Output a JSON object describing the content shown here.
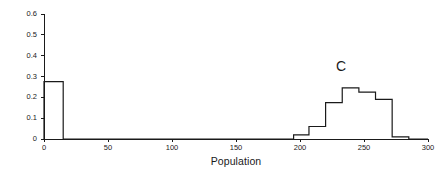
{
  "chart_data": {
    "type": "bar",
    "title": "",
    "subtitle": "",
    "xlabel": "Population",
    "ylabel": "Fraction of Runs",
    "xlim": [
      0,
      300
    ],
    "ylim": [
      0,
      0.6
    ],
    "xticks": [
      0,
      50,
      100,
      150,
      200,
      250,
      300
    ],
    "xtick_labels": [
      "0",
      "50",
      "100",
      "150",
      "200",
      "250",
      "300"
    ],
    "yticks": [
      0,
      0.1,
      0.2,
      0.3,
      0.4,
      0.5,
      0.6
    ],
    "ytick_labels": [
      "0",
      "0.1",
      "0.2",
      "0.3",
      "0.4",
      "0.5",
      "0.6"
    ],
    "grid": false,
    "legend": "none",
    "style": "histogram-step-outline",
    "line_color": "#1a1a1a",
    "annotations": [
      {
        "text": "C",
        "x": 232,
        "y": 0.35
      }
    ],
    "bin_edges": [
      0,
      15,
      195,
      207,
      220,
      233,
      246,
      259,
      272,
      285,
      300
    ],
    "values": [
      0.275,
      0,
      0.02,
      0.06,
      0.175,
      0.245,
      0.225,
      0.19,
      0.01,
      0
    ],
    "bins": [
      {
        "x0": 0,
        "x1": 15,
        "value": 0.275
      },
      {
        "x0": 15,
        "x1": 195,
        "value": 0
      },
      {
        "x0": 195,
        "x1": 207,
        "value": 0.02
      },
      {
        "x0": 207,
        "x1": 220,
        "value": 0.06
      },
      {
        "x0": 220,
        "x1": 233,
        "value": 0.175
      },
      {
        "x0": 233,
        "x1": 246,
        "value": 0.245
      },
      {
        "x0": 246,
        "x1": 259,
        "value": 0.225
      },
      {
        "x0": 259,
        "x1": 272,
        "value": 0.19
      },
      {
        "x0": 272,
        "x1": 285,
        "value": 0.01
      },
      {
        "x0": 285,
        "x1": 300,
        "value": 0
      }
    ]
  },
  "axes": {
    "y_title": "Fraction of Runs",
    "x_title": "Population"
  }
}
